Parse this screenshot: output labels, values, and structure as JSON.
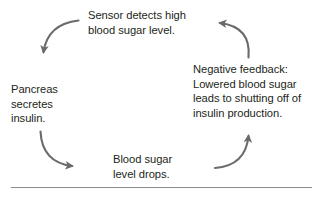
{
  "diagram": {
    "title_text": "",
    "type": "cycle",
    "background_color": "#ffffff",
    "text_color": "#231f20",
    "arrow_color": "#6b6b6b",
    "rule_color": "#8b8b8b",
    "nodes": [
      {
        "id": "sensor",
        "label": "Sensor detects high\nblood sugar level.",
        "position": "top-center"
      },
      {
        "id": "pancreas",
        "label": "Pancreas\nsecretes\ninsulin.",
        "position": "left"
      },
      {
        "id": "blood-sugar-drops",
        "label": "Blood sugar\nlevel drops.",
        "position": "bottom-center"
      },
      {
        "id": "negative-feedback",
        "label": "Negative feedback:\nLowered blood sugar\nleads to shutting off of\ninsulin production.",
        "position": "right"
      }
    ],
    "arrows": [
      {
        "id": "sensor-to-pancreas",
        "from": "sensor",
        "to": "pancreas",
        "direction": "down",
        "icon": "curved-arrow-icon"
      },
      {
        "id": "pancreas-to-drops",
        "from": "pancreas",
        "to": "blood-sugar-drops",
        "direction": "right",
        "icon": "curved-arrow-icon"
      },
      {
        "id": "drops-to-negative-feedback",
        "from": "blood-sugar-drops",
        "to": "negative-feedback",
        "direction": "up",
        "icon": "curved-arrow-icon"
      },
      {
        "id": "negative-feedback-to-sensor",
        "from": "negative-feedback",
        "to": "sensor",
        "direction": "left",
        "icon": "curved-arrow-icon"
      }
    ]
  }
}
